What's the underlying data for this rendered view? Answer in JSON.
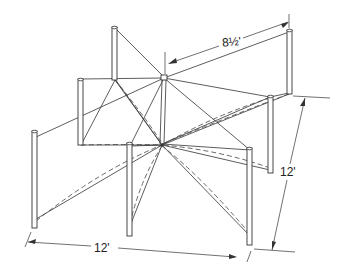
{
  "diagram": {
    "dimensions": {
      "span_diagonal": "8½'",
      "width_front": "12'",
      "depth_right": "12'"
    },
    "posts": [
      {
        "id": "A",
        "position": "back-left-upper"
      },
      {
        "id": "B",
        "position": "back-right-upper"
      },
      {
        "id": "C",
        "position": "left-middle"
      },
      {
        "id": "D",
        "position": "left-front"
      },
      {
        "id": "E",
        "position": "center-front"
      },
      {
        "id": "F",
        "position": "right-middle"
      },
      {
        "id": "G",
        "position": "right-front"
      }
    ],
    "nodes": [
      {
        "id": "center-top",
        "label": ""
      },
      {
        "id": "center-bottom",
        "label": ""
      }
    ],
    "line_styles": {
      "solid": "cable",
      "dashed": "catenary curve"
    },
    "colors": {
      "stroke": "#333333",
      "background": "#ffffff"
    }
  }
}
